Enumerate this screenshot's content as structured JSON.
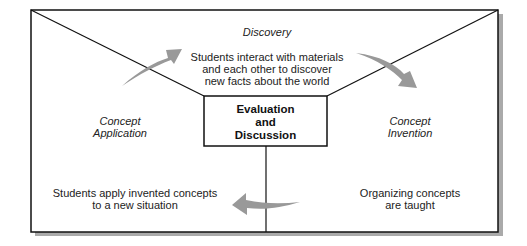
{
  "diagram": {
    "center": {
      "line1": "Evaluation",
      "line2": "and",
      "line3": "Discussion"
    },
    "discovery": {
      "title": "Discovery",
      "desc1": "Students interact with materials",
      "desc2": "and each other to discover",
      "desc3": "new facts about the world"
    },
    "invention": {
      "title1": "Concept",
      "title2": "Invention",
      "desc1": "Organizing concepts",
      "desc2": "are taught"
    },
    "application": {
      "title1": "Concept",
      "title2": "Application",
      "desc1": "Students apply invented concepts",
      "desc2": "to a new situation"
    },
    "colors": {
      "arrow": "#999999",
      "shadow": "#a8a8a8",
      "line": "#111111"
    }
  }
}
